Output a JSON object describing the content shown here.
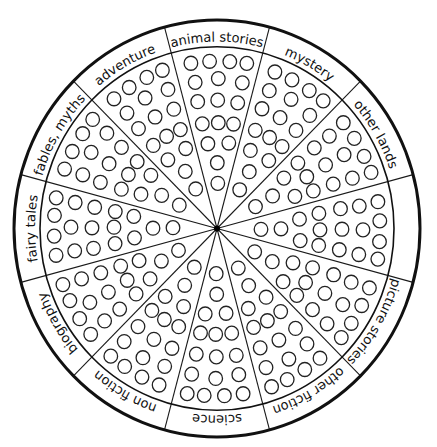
{
  "diagram": {
    "type": "reading-wheel",
    "sectors": [
      {
        "label": "animal stories",
        "slots": 17
      },
      {
        "label": "mystery",
        "slots": 17
      },
      {
        "label": "other lands",
        "slots": 17
      },
      {
        "label": "",
        "slots": 17
      },
      {
        "label": "picture stories",
        "slots": 17
      },
      {
        "label": "other fiction",
        "slots": 17
      },
      {
        "label": "science",
        "slots": 17
      },
      {
        "label": "non fiction",
        "slots": 17
      },
      {
        "label": "biography",
        "slots": 17
      },
      {
        "label": "fairy tales",
        "slots": 17
      },
      {
        "label": "fables, myths",
        "slots": 17
      },
      {
        "label": "adventure",
        "slots": 17
      }
    ],
    "colors": {
      "ink": "#111111",
      "paper": "#ffffff"
    }
  }
}
